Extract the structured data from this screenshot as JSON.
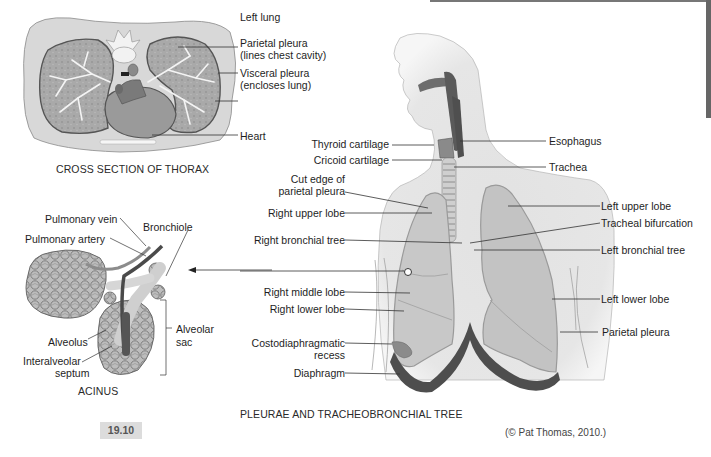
{
  "figure": {
    "number": "19.10",
    "copyright": "(© Pat Thomas, 2010.)"
  },
  "cross_section": {
    "caption": "CROSS SECTION OF THORAX",
    "labels": {
      "left_lung": "Left lung",
      "parietal_pleura": "Parietal pleura",
      "parietal_pleura_note": "(lines chest cavity)",
      "visceral_pleura": "Visceral pleura",
      "visceral_pleura_note": "(encloses lung)",
      "heart": "Heart"
    }
  },
  "acinus": {
    "caption": "ACINUS",
    "labels": {
      "pulmonary_vein": "Pulmonary vein",
      "pulmonary_artery": "Pulmonary artery",
      "bronchiole": "Bronchiole",
      "alveolus": "Alveolus",
      "interalveolar_1": "Interalveolar",
      "interalveolar_2": "septum",
      "alveolar_sac_1": "Alveolar",
      "alveolar_sac_2": "sac"
    }
  },
  "tree": {
    "caption": "PLEURAE AND TRACHEOBRONCHIAL TREE",
    "left_labels": {
      "thyroid_cartilage": "Thyroid cartilage",
      "cricoid_cartilage": "Cricoid cartilage",
      "cut_edge_1": "Cut edge of",
      "cut_edge_2": "parietal pleura",
      "right_upper_lobe": "Right upper lobe",
      "right_bronchial_tree": "Right bronchial tree",
      "right_middle_lobe": "Right middle lobe",
      "right_lower_lobe": "Right lower lobe",
      "costo_1": "Costodiaphragmatic",
      "costo_2": "recess",
      "diaphragm": "Diaphragm"
    },
    "right_labels": {
      "esophagus": "Esophagus",
      "trachea": "Trachea",
      "left_upper_lobe": "Left upper lobe",
      "tracheal_bifurcation": "Tracheal bifurcation",
      "left_bronchial_tree": "Left bronchial tree",
      "left_lower_lobe": "Left lower lobe",
      "parietal_pleura": "Parietal pleura"
    }
  }
}
